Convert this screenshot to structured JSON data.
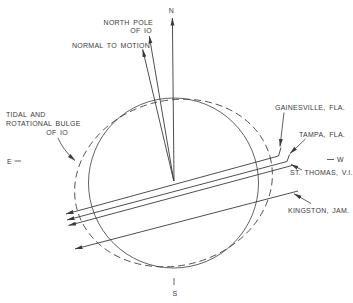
{
  "colors": {
    "background": "#ffffff",
    "line": "#3b3b3b",
    "text": "#3b3b3b"
  },
  "compass": {
    "north": "N",
    "south": "S",
    "east": "E",
    "west": "W"
  },
  "axis_labels": {
    "north_pole_line1": "NORTH POLE",
    "north_pole_line2": "OF IO",
    "normal_to_motion": "NORMAL TO MOTION"
  },
  "bulge_label": {
    "line1": "TIDAL AND",
    "line2": "ROTATIONAL BULGE",
    "line3": "OF IO"
  },
  "stations": [
    {
      "label": "GAINESVILLE, FLA."
    },
    {
      "label": "TAMPA, FLA."
    },
    {
      "label": "ST. THOMAS, V.I."
    },
    {
      "label": "KINGSTON, JAM."
    }
  ]
}
